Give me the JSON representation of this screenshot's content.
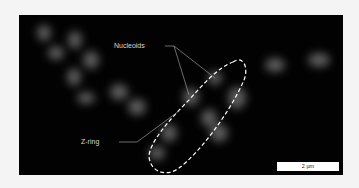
{
  "figure": {
    "labels": {
      "nucleoids": "Nucleoids",
      "z_ring": "Z-ring"
    },
    "scale_bar": "2 µm",
    "colors": {
      "background": "#020202",
      "cells": "#5a5a5a",
      "outline": "#ffffff",
      "page": "#f4f4f4"
    }
  }
}
